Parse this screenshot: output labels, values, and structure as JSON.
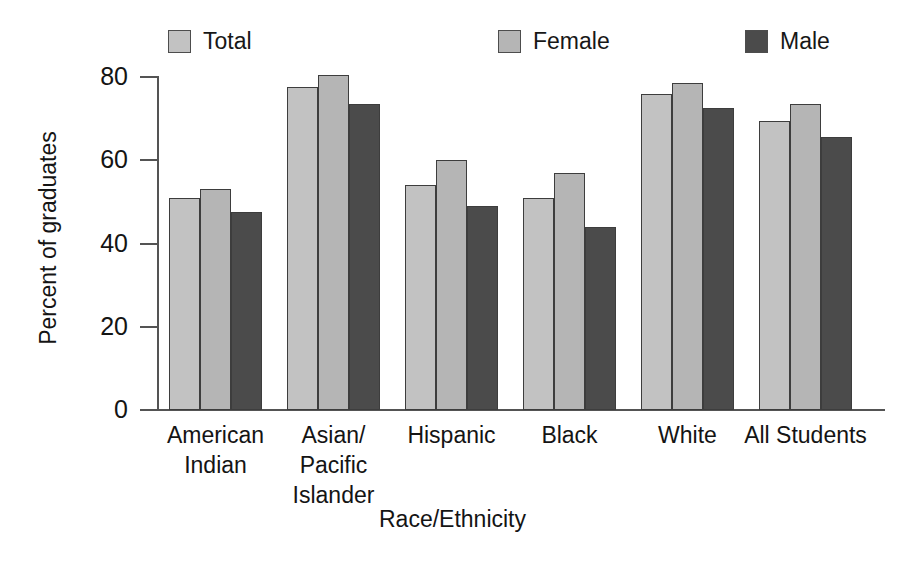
{
  "chart_data": {
    "type": "bar",
    "title": "",
    "xlabel": "Race/Ethnicity",
    "ylabel": "Percent of graduates",
    "ylim": [
      0,
      80
    ],
    "yticks": [
      0,
      20,
      40,
      60,
      80
    ],
    "ytick_labels": [
      "0",
      "20",
      "40",
      "60",
      "80"
    ],
    "grid": false,
    "legend_position": "top",
    "categories": [
      "American Indian",
      "Asian/ Pacific Islander",
      "Hispanic",
      "Black",
      "White",
      "All Students"
    ],
    "category_lines": [
      [
        "American",
        "Indian"
      ],
      [
        "Asian/",
        "Pacific",
        "Islander"
      ],
      [
        "Hispanic"
      ],
      [
        "Black"
      ],
      [
        "White"
      ],
      [
        "All Students"
      ]
    ],
    "series": [
      {
        "name": "Total",
        "color": "#c2c2c2",
        "values": [
          51,
          77.5,
          54,
          51,
          76,
          69.5
        ]
      },
      {
        "name": "Female",
        "color": "#b5b5b5",
        "values": [
          53,
          80.5,
          60,
          57,
          78.5,
          73.5
        ]
      },
      {
        "name": "Male",
        "color": "#4b4b4b",
        "values": [
          47.5,
          73.5,
          49,
          44,
          72.5,
          65.5
        ]
      }
    ]
  },
  "legend": {
    "items": [
      {
        "label": "Total",
        "color": "#c2c2c2"
      },
      {
        "label": "Female",
        "color": "#b5b5b5"
      },
      {
        "label": "Male",
        "color": "#4b4b4b"
      }
    ]
  },
  "axes": {
    "y_title": "Percent of graduates",
    "x_title": "Race/Ethnicity"
  }
}
